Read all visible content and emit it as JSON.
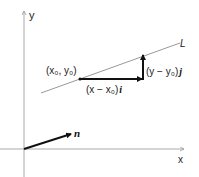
{
  "diagram": {
    "axes": {
      "x_label": "x",
      "y_label": "y"
    },
    "line_label": "L",
    "point_label": "(x₀, y₀)",
    "horizontal_vector_label": {
      "text": "(x − x₀)",
      "unit": "i"
    },
    "vertical_vector_label": {
      "text": "(y − y₀)",
      "unit": "j"
    },
    "normal_vector_label": "n",
    "colors": {
      "axis": "#999999",
      "line": "#888888",
      "vector": "#111111"
    }
  }
}
